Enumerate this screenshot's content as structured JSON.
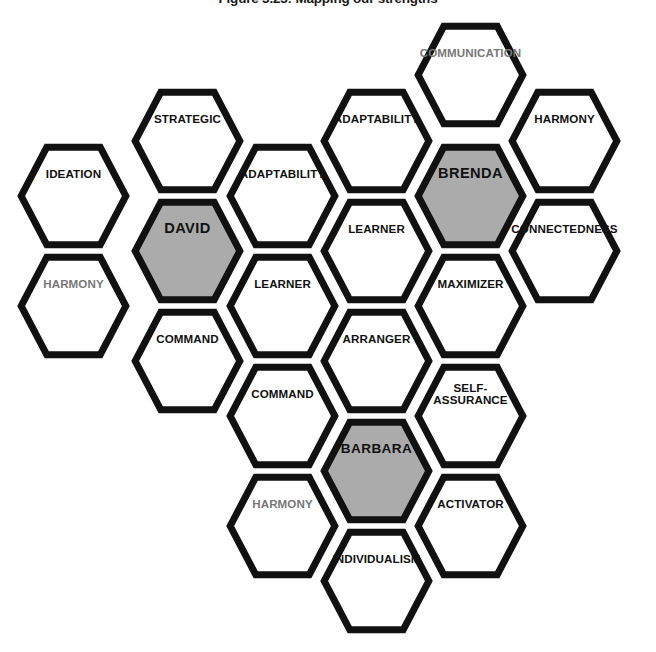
{
  "figure": {
    "title": "Figure 3.23: Mapping our strengths",
    "colors": {
      "stroke": "#111111",
      "person_fill": "#ababab",
      "strength_fill": "#ffffff",
      "muted_text": "#777777",
      "text": "#111111",
      "background": "#ffffff"
    },
    "geometry": {
      "hex_width": 113,
      "hex_height": 106,
      "column_step": 94,
      "row_step": 110,
      "row_offset": 55
    }
  },
  "people": [
    "DAVID",
    "BRENDA",
    "BARBARA"
  ],
  "cells": [
    {
      "id": "communication",
      "label": "COMMUNICATION",
      "kind": "strength",
      "muted": true,
      "x": 414,
      "y": 22,
      "font": "small"
    },
    {
      "id": "strategic",
      "label": "STRATEGIC",
      "kind": "strength",
      "muted": false,
      "x": 131,
      "y": 88,
      "font": "normal"
    },
    {
      "id": "adaptability-top",
      "label": "ADAPTABILITY",
      "kind": "strength",
      "muted": false,
      "x": 320,
      "y": 88,
      "font": "normal"
    },
    {
      "id": "harmony-top-right",
      "label": "HARMONY",
      "kind": "strength",
      "muted": false,
      "x": 508,
      "y": 88,
      "font": "normal"
    },
    {
      "id": "ideation",
      "label": "IDEATION",
      "kind": "strength",
      "muted": false,
      "x": 17,
      "y": 143,
      "font": "normal"
    },
    {
      "id": "adaptability-mid",
      "label": "ADAPTABILITY",
      "kind": "strength",
      "muted": false,
      "x": 226,
      "y": 143,
      "font": "normal"
    },
    {
      "id": "brenda",
      "label": "BRENDA",
      "kind": "person",
      "muted": false,
      "x": 414,
      "y": 143,
      "font": "normal"
    },
    {
      "id": "david",
      "label": "DAVID",
      "kind": "person",
      "muted": false,
      "x": 131,
      "y": 198,
      "font": "normal"
    },
    {
      "id": "learner-upper",
      "label": "LEARNER",
      "kind": "strength",
      "muted": false,
      "x": 320,
      "y": 198,
      "font": "normal"
    },
    {
      "id": "connectedness",
      "label": "CONNECTEDNESS",
      "kind": "strength",
      "muted": false,
      "x": 508,
      "y": 198,
      "font": "small"
    },
    {
      "id": "harmony-left",
      "label": "HARMONY",
      "kind": "strength",
      "muted": true,
      "x": 17,
      "y": 253,
      "font": "normal"
    },
    {
      "id": "learner-mid",
      "label": "LEARNER",
      "kind": "strength",
      "muted": false,
      "x": 226,
      "y": 253,
      "font": "normal"
    },
    {
      "id": "maximizer",
      "label": "MAXIMIZER",
      "kind": "strength",
      "muted": false,
      "x": 414,
      "y": 253,
      "font": "normal"
    },
    {
      "id": "command-upper",
      "label": "COMMAND",
      "kind": "strength",
      "muted": false,
      "x": 131,
      "y": 308,
      "font": "normal"
    },
    {
      "id": "arranger",
      "label": "ARRANGER",
      "kind": "strength",
      "muted": false,
      "x": 320,
      "y": 308,
      "font": "normal"
    },
    {
      "id": "command-lower",
      "label": "COMMAND",
      "kind": "strength",
      "muted": false,
      "x": 226,
      "y": 363,
      "font": "normal"
    },
    {
      "id": "self-assurance",
      "label": "SELF-\nASSURANCE",
      "kind": "strength",
      "muted": false,
      "x": 414,
      "y": 363,
      "font": "normal"
    },
    {
      "id": "barbara",
      "label": "BARBARA",
      "kind": "person",
      "muted": false,
      "x": 320,
      "y": 418,
      "font": "small"
    },
    {
      "id": "harmony-bottom",
      "label": "HARMONY",
      "kind": "strength",
      "muted": true,
      "x": 226,
      "y": 473,
      "font": "normal"
    },
    {
      "id": "activator",
      "label": "ACTIVATOR",
      "kind": "strength",
      "muted": false,
      "x": 414,
      "y": 473,
      "font": "normal"
    },
    {
      "id": "individualism",
      "label": "INDIVIDUALISM",
      "kind": "strength",
      "muted": false,
      "x": 320,
      "y": 528,
      "font": "small"
    }
  ]
}
